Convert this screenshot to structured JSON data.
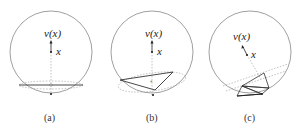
{
  "figure": {
    "panels": [
      {
        "id": "a",
        "caption": "(a)",
        "point_label": "x",
        "image_label": "v(x)",
        "description": "Sphere with horizontal flat cut near bottom; x projected straight down to cut"
      },
      {
        "id": "b",
        "caption": "(b)",
        "point_label": "x",
        "image_label": "v(x)",
        "description": "Sphere with a tilted triangle face near the bottom"
      },
      {
        "id": "c",
        "caption": "(c)",
        "point_label": "x",
        "image_label": "v(x)",
        "description": "Sphere with tilted plane and small triangulated patch near bottom"
      }
    ],
    "colors": {
      "circle": "#888888",
      "solid_line": "#333333",
      "dashed_line": "#999999",
      "point": "#222222"
    }
  }
}
